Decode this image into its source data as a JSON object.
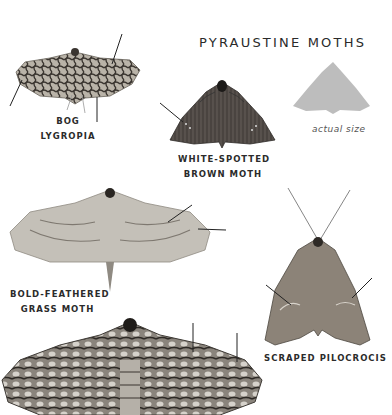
{
  "page": {
    "title": "PYRAUSTINE MOTHS",
    "colors": {
      "background": "#ffffff",
      "text": "#2b2b2b",
      "silhouette": "#bdbdbd"
    }
  },
  "size_reference": {
    "caption": "actual size",
    "icon": "moth-silhouette-icon"
  },
  "moths": [
    {
      "name_line1": "BOG",
      "name_line2": "LYGROPIA",
      "pointer_arrows": 3
    },
    {
      "name_line1": "WHITE-SPOTTED",
      "name_line2": "BROWN MOTH",
      "pointer_arrows": 1
    },
    {
      "name_line1": "BOLD-FEATHERED",
      "name_line2": "GRASS MOTH",
      "pointer_arrows": 2
    },
    {
      "name_line1": "SCRAPED PILOCROCIS",
      "name_line2": "",
      "pointer_arrows": 2
    },
    {
      "name_line1": "",
      "name_line2": "",
      "pointer_arrows": 2
    }
  ]
}
